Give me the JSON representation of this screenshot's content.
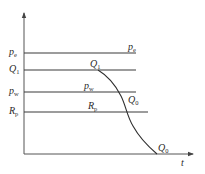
{
  "diagram": {
    "colors": {
      "line": "#3a3a3a",
      "axis": "#555555",
      "background": "#ffffff"
    },
    "axes": {
      "x_label": "t",
      "y_label": ""
    },
    "y_axis_labels": [
      {
        "base": "p",
        "sub": "e"
      },
      {
        "base": "Q",
        "sub": "1"
      },
      {
        "base": "p",
        "sub": "w"
      },
      {
        "base": "R",
        "sub": "p"
      }
    ],
    "line_labels": {
      "pe": {
        "base": "p",
        "sub": "e"
      },
      "q1": {
        "base": "Q",
        "sub": "1"
      },
      "pw": {
        "base": "p",
        "sub": "w"
      },
      "rp": {
        "base": "R",
        "sub": "p"
      },
      "q0_mid": {
        "base": "Q",
        "sub": "0"
      },
      "q0_end": {
        "base": "Q",
        "sub": "0"
      }
    },
    "horizontal_lines": [
      {
        "name": "p_e",
        "y": 53,
        "x_end": 136
      },
      {
        "name": "Q_1",
        "y": 70,
        "x_end": 136
      },
      {
        "name": "p_w",
        "y": 92,
        "x_end": 136
      },
      {
        "name": "R_p",
        "y": 112,
        "x_end": 148
      }
    ],
    "curve": {
      "name": "Q decline",
      "start": {
        "x": 98,
        "y": 70
      },
      "end": {
        "x": 157,
        "y": 154
      }
    }
  }
}
